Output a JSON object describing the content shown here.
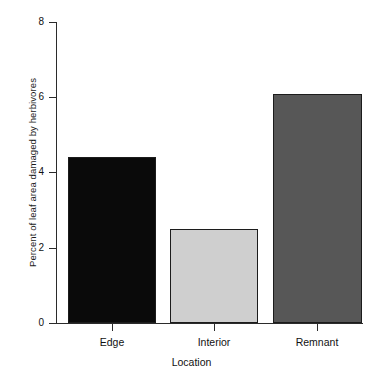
{
  "chart_data": {
    "type": "bar",
    "title": "",
    "subtitle": "",
    "categories": [
      "Edge",
      "Interior",
      "Remnant"
    ],
    "values": [
      4.4,
      2.5,
      6.1
    ],
    "series": [
      {
        "name": "Percent of leaf area damaged by herbivores",
        "values": [
          4.4,
          2.5,
          6.1
        ]
      }
    ],
    "bar_colors": [
      "#0a0a0a",
      "#cfcfcf",
      "#575757"
    ],
    "bar_border_color": "#1c1c1c",
    "xlabel": "Location",
    "ylabel": "Percent of leaf area damaged by herbivores",
    "ylim": [
      0,
      8
    ],
    "yticks": [
      0,
      2,
      4,
      6,
      8
    ],
    "ytick_labels": [
      "0",
      "2",
      "4",
      "6",
      "8"
    ],
    "xtick_labels": [
      "Edge",
      "Interior",
      "Remnant"
    ],
    "grid": false,
    "legend": null,
    "legend_position": "none",
    "annotations": []
  },
  "axes": {
    "y_label": "Percent of leaf area damaged by herbivores",
    "x_label": "Location",
    "y_ticks": [
      {
        "label": "8",
        "value": 8
      },
      {
        "label": "6",
        "value": 6
      },
      {
        "label": "4",
        "value": 4
      },
      {
        "label": "2",
        "value": 2
      },
      {
        "label": "0",
        "value": 0
      }
    ],
    "x_ticks": [
      {
        "label": "Edge"
      },
      {
        "label": "Interior"
      },
      {
        "label": "Remnant"
      }
    ]
  },
  "bars": [
    {
      "category": "Edge",
      "value": 4.4,
      "color": "#0a0a0a"
    },
    {
      "category": "Interior",
      "value": 2.5,
      "color": "#cfcfcf"
    },
    {
      "category": "Remnant",
      "value": 6.1,
      "color": "#575757"
    }
  ]
}
